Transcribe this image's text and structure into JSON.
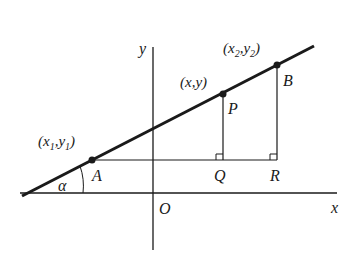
{
  "diagram": {
    "axes": {
      "x_label": "x",
      "y_label": "y",
      "origin_label": "O"
    },
    "angle": {
      "label": "α"
    },
    "points": {
      "A": {
        "name": "A",
        "coord_label": {
          "open": "(",
          "x": "x",
          "xsub": "1",
          "comma": ",",
          "y": "y",
          "ysub": "1",
          "close": ")"
        }
      },
      "P": {
        "name": "P",
        "coord_label": "(x,y)"
      },
      "B": {
        "name": "B",
        "coord_label": {
          "open": "(",
          "x": "x",
          "xsub": "2",
          "comma": ",",
          "y": "y",
          "ysub": "2",
          "close": ")"
        }
      },
      "Q": {
        "name": "Q"
      },
      "R": {
        "name": "R"
      }
    },
    "colors": {
      "ink": "#1a1a1a",
      "background": "#ffffff"
    }
  }
}
